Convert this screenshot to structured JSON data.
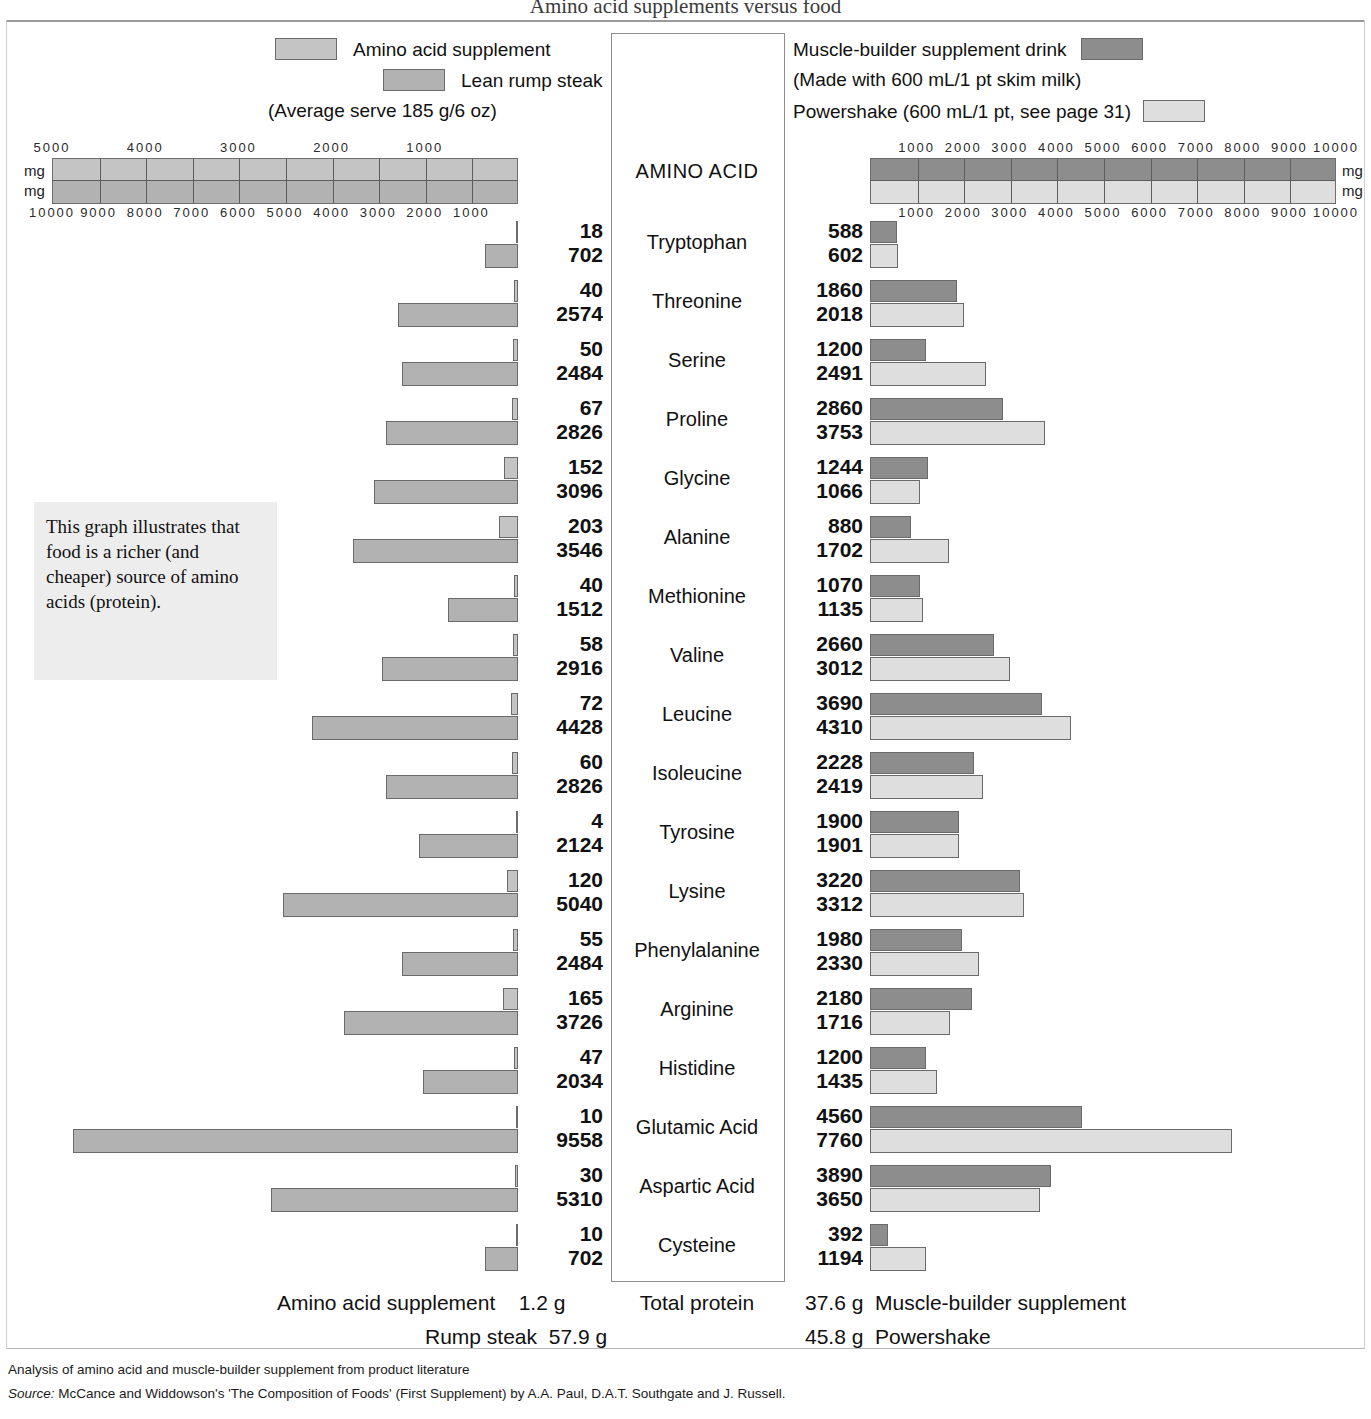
{
  "title": "Amino acid supplements versus food",
  "legend": {
    "left": {
      "amino_acid_supplement": "Amino acid supplement",
      "lean_rump_steak": "Lean rump steak",
      "serve_note": "(Average serve 185 g/6 oz)"
    },
    "right": {
      "muscle_builder": "Muscle-builder supplement drink",
      "milk_note": "(Made with 600 mL/1 pt skim milk)",
      "powershake": "Powershake (600 mL/1 pt, see page 31)"
    }
  },
  "centre_header": "AMINO ACID",
  "callout": "This graph illustrates that food is a richer (and cheaper) source of amino acids (protein).",
  "axes": {
    "unit_label": "mg",
    "left_top_ticks": [
      5000,
      4000,
      3000,
      2000,
      1000
    ],
    "left_bottom_ticks": [
      10000,
      9000,
      8000,
      7000,
      6000,
      5000,
      4000,
      3000,
      2000,
      1000
    ],
    "right_top_ticks": [
      1000,
      2000,
      3000,
      4000,
      5000,
      6000,
      7000,
      8000,
      9000,
      10000
    ],
    "right_bottom_ticks": [
      1000,
      2000,
      3000,
      4000,
      5000,
      6000,
      7000,
      8000,
      9000,
      10000
    ],
    "left_top_max": 5000,
    "left_bottom_max": 10000,
    "right_max": 10000
  },
  "totals": {
    "left_label_1": "Amino acid supplement",
    "left_value_1": "1.2 g",
    "left_label_2": "Rump steak",
    "left_value_2": "57.9 g",
    "centre_label": "Total protein",
    "right_value_1": "37.6 g",
    "right_label_1": "Muscle-builder supplement",
    "right_value_2": "45.8 g",
    "right_label_2": "Powershake"
  },
  "footnotes": {
    "line1": "Analysis of amino acid and muscle-builder supplement from product literature",
    "line2_prefix": "Source:",
    "line2": " McCance and Widdowson's 'The Composition of Foods' (First Supplement) by A.A. Paul, D.A.T. Southgate and J. Russell."
  },
  "colors": {
    "amino_acid_supplement": "#c4c4c4",
    "lean_rump_steak": "#b2b2b2",
    "muscle_builder": "#8d8d8d",
    "powershake": "#dedede",
    "callout_bg": "#ededed",
    "border": "#6a6a6a"
  },
  "chart_data": {
    "type": "bar",
    "title": "Amino acid supplements versus food",
    "xlabel": "mg",
    "ylabel": "",
    "orientation": "horizontal",
    "grid": true,
    "legend_position": "top",
    "categories": [
      "Tryptophan",
      "Threonine",
      "Serine",
      "Proline",
      "Glycine",
      "Alanine",
      "Methionine",
      "Valine",
      "Leucine",
      "Isoleucine",
      "Tyrosine",
      "Lysine",
      "Phenylalanine",
      "Arginine",
      "Histidine",
      "Glutamic Acid",
      "Aspartic Acid",
      "Cysteine"
    ],
    "panels": [
      {
        "side": "left",
        "direction": "right-to-left",
        "series": [
          {
            "name": "Amino acid supplement",
            "color": "#c4c4c4",
            "axis_max": 5000,
            "values": [
              18,
              40,
              50,
              67,
              152,
              203,
              40,
              58,
              72,
              60,
              4,
              120,
              55,
              165,
              47,
              10,
              30,
              10
            ]
          },
          {
            "name": "Lean rump steak",
            "color": "#b2b2b2",
            "axis_max": 10000,
            "values": [
              702,
              2574,
              2484,
              2826,
              3096,
              3546,
              1512,
              2916,
              4428,
              2826,
              2124,
              5040,
              2484,
              3726,
              2034,
              9558,
              5310,
              702
            ]
          }
        ]
      },
      {
        "side": "right",
        "direction": "left-to-right",
        "series": [
          {
            "name": "Muscle-builder supplement drink",
            "color": "#8d8d8d",
            "axis_max": 10000,
            "values": [
              588,
              1860,
              1200,
              2860,
              1244,
              880,
              1070,
              2660,
              3690,
              2228,
              1900,
              3220,
              1980,
              2180,
              1200,
              4560,
              3890,
              392
            ]
          },
          {
            "name": "Powershake",
            "color": "#dedede",
            "axis_max": 10000,
            "values": [
              602,
              2018,
              2491,
              3753,
              1066,
              1702,
              1135,
              3012,
              4310,
              2419,
              1901,
              3312,
              2330,
              1716,
              1435,
              7760,
              3650,
              1194
            ]
          }
        ]
      }
    ],
    "total_protein_g": {
      "Amino acid supplement": 1.2,
      "Rump steak": 57.9,
      "Muscle-builder supplement": 37.6,
      "Powershake": 45.8
    }
  }
}
